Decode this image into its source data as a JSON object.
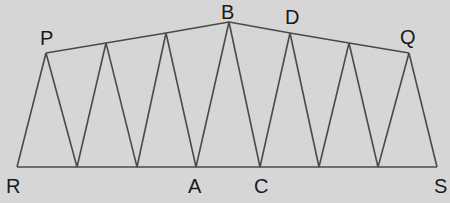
{
  "diagram": {
    "background": "#d6d6d6",
    "line_color": "#4a4a4a",
    "labels": [
      {
        "text": "P",
        "x": 40,
        "y": 28
      },
      {
        "text": "B",
        "x": 221,
        "y": 2
      },
      {
        "text": "D",
        "x": 285,
        "y": 7
      },
      {
        "text": "Q",
        "x": 400,
        "y": 27
      },
      {
        "text": "R",
        "x": 6,
        "y": 176
      },
      {
        "text": "A",
        "x": 188,
        "y": 176
      },
      {
        "text": "C",
        "x": 254,
        "y": 176
      },
      {
        "text": "S",
        "x": 434,
        "y": 176
      }
    ],
    "bottom_points": [
      [
        17,
        167
      ],
      [
        77,
        167
      ],
      [
        137,
        167
      ],
      [
        196,
        167
      ],
      [
        260,
        167
      ],
      [
        319,
        167
      ],
      [
        378,
        167
      ],
      [
        437,
        167
      ]
    ],
    "top_points": [
      [
        46,
        53
      ],
      [
        106,
        43
      ],
      [
        166,
        33
      ],
      [
        229,
        22
      ],
      [
        290,
        33
      ],
      [
        349,
        43
      ],
      [
        409,
        53
      ]
    ]
  }
}
